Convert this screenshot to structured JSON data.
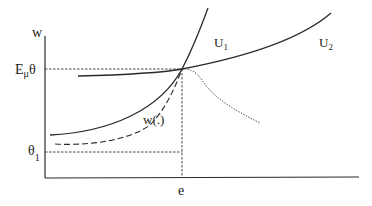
{
  "diagram": {
    "type": "economics-indifference-curves",
    "axes": {
      "y_label": "w",
      "x_label": "e"
    },
    "labels": {
      "e_mu_theta": {
        "main": "E",
        "sub": "μ",
        "tail": "θ"
      },
      "theta_1": {
        "main": "θ",
        "sub": "1"
      },
      "u1": {
        "main": "U",
        "sub": "1"
      },
      "u2": {
        "main": "U",
        "sub": "2"
      },
      "w_func": "w(.)"
    },
    "curves": [
      {
        "name": "U1",
        "style": "solid",
        "description": "steep convex indifference curve through intersection point"
      },
      {
        "name": "U2",
        "style": "solid",
        "description": "flatter indifference curve through intersection point"
      },
      {
        "name": "w(.)",
        "style": "dashed",
        "description": "wage schedule rising to intersection point"
      },
      {
        "name": "unlabeled",
        "style": "dotted",
        "description": "declining curve from intersection point"
      }
    ],
    "guides": [
      {
        "name": "E_mu_theta-level",
        "style": "dashed",
        "orientation": "horizontal"
      },
      {
        "name": "theta_1-level",
        "style": "dashed",
        "orientation": "horizontal"
      },
      {
        "name": "e-level",
        "style": "dashed",
        "orientation": "vertical"
      }
    ],
    "colors": {
      "stroke": "#2a2a2a",
      "background": "#ffffff"
    }
  }
}
